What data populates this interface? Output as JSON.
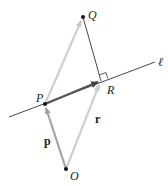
{
  "diagram": {
    "points": {
      "Q": {
        "label": "Q",
        "x": 83,
        "y": 17
      },
      "P": {
        "label": "P",
        "x": 45,
        "y": 104
      },
      "R": {
        "label": "R",
        "x": 101,
        "y": 81
      },
      "O": {
        "label": "O",
        "x": 66,
        "y": 169
      }
    },
    "line_label": "ℓ",
    "vectors": {
      "p": "p",
      "r": "r"
    },
    "colors": {
      "light_vector": "#c8c8c8",
      "medium_vector": "#a0a0a0",
      "dark_vector": "#555555",
      "line": "#333333",
      "point": "#111111"
    }
  }
}
